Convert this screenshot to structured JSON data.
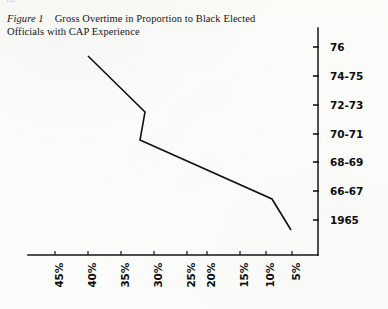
{
  "page": {
    "running_head": "102",
    "background_color": "#fdfdfb",
    "ink_color": "#16161a"
  },
  "caption": {
    "figure_label": "Figure 1",
    "title": "Gross Overtime in Proportion to Black Elected Officials with CAP Experience"
  },
  "chart_data": {
    "type": "line",
    "title": "Gross Overtime in Proportion to Black Elected Officials with CAP Experience",
    "xlabel": "",
    "ylabel": "",
    "orientation": "horizontal-percent-vs-year",
    "grid": false,
    "legend": null,
    "axis_style": {
      "x_axis_position": "bottom",
      "y_axis_position": "right",
      "x_direction": "decreasing-left-to-right",
      "y_direction": "decreasing-top-to-bottom"
    },
    "categories": [
      "76",
      "74-75",
      "72-73",
      "70-71",
      "68-69",
      "66-67",
      "1965"
    ],
    "y_tick_labels": [
      "76",
      "74-75",
      "72-73",
      "70-71",
      "68-69",
      "66-67",
      "1965"
    ],
    "x_tick_labels": [
      "45%",
      "40%",
      "35%",
      "30%",
      "25%",
      "20%",
      "15%",
      "10%",
      "5%"
    ],
    "x_tick_values": [
      45,
      40,
      35,
      30,
      25,
      20,
      15,
      10,
      5
    ],
    "xlim": [
      47.5,
      2.5
    ],
    "series": [
      {
        "name": "Gross overtime share",
        "values": [
          38.0,
          28.5,
          29.5,
          22.5,
          15.5,
          7.5,
          4.5
        ],
        "points": [
          {
            "category": "76",
            "percent": 38.0
          },
          {
            "category": "74-75",
            "percent": 28.5
          },
          {
            "category": "72-73",
            "percent": 29.5
          },
          {
            "category": "66-67",
            "percent": 7.5
          },
          {
            "category": "1965",
            "percent": 4.5
          }
        ],
        "vertices_px": [
          [
            88,
            56
          ],
          [
            145,
            112
          ],
          [
            140,
            140
          ],
          [
            272,
            199
          ],
          [
            291,
            230
          ]
        ],
        "color": "#111114",
        "line_width": 1.6
      }
    ]
  },
  "geometry": {
    "x_axis": {
      "x_start": 28,
      "x_end": 318,
      "y": 255
    },
    "y_axis": {
      "x": 318,
      "y_start": 28,
      "y_end": 255
    },
    "y_tick_y": [
      47,
      76,
      105,
      134,
      162,
      191,
      220
    ],
    "x_tick_x": [
      55,
      88,
      121,
      154,
      187,
      207,
      240,
      266,
      292
    ],
    "x_label_x": [
      53,
      86,
      119,
      152,
      185,
      205,
      238,
      264,
      290
    ]
  }
}
